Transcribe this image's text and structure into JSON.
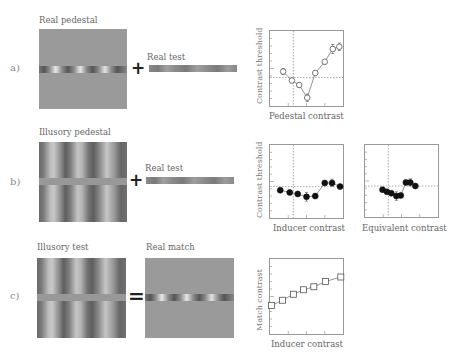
{
  "rows": [
    {
      "row_label": "a)",
      "stimulus_label": "Real pedestal",
      "stimulus_type": "real-grating-strip-on-uniform-gray",
      "operator": "+",
      "test_label": "Real test"
    },
    {
      "row_label": "b)",
      "stimulus_label": "Illusory pedestal",
      "stimulus_type": "inducing-grating-with-gray-strip",
      "operator": "+",
      "test_label": "Real test"
    },
    {
      "row_label": "c)",
      "stimulus_label": "Illusory test",
      "stimulus_type": "inducing-grating-with-gray-strip",
      "operator": "=",
      "test_label": "Real match"
    }
  ],
  "chart_data": [
    {
      "id": "a",
      "type": "line",
      "title": "",
      "xlabel": "Pedestal contrast",
      "ylabel": "Contrast threshold",
      "marker": "open-circle",
      "grid": false,
      "reference_lines": {
        "vertical_x": 0.32,
        "horizontal_y": 0.62
      },
      "points": [
        {
          "x": 0.18,
          "y": 0.54,
          "err": 0.04
        },
        {
          "x": 0.3,
          "y": 0.66,
          "err": 0.03
        },
        {
          "x": 0.4,
          "y": 0.72,
          "err": 0.03
        },
        {
          "x": 0.51,
          "y": 0.89,
          "err": 0.05
        },
        {
          "x": 0.62,
          "y": 0.56,
          "err": 0.03
        },
        {
          "x": 0.75,
          "y": 0.41,
          "err": 0.03
        },
        {
          "x": 0.86,
          "y": 0.24,
          "err": 0.06
        },
        {
          "x": 0.95,
          "y": 0.21,
          "err": 0.05
        }
      ],
      "note": "Normalized frame coordinates (x: 0=left,1=right; y: 0=top,1=bottom). Dipper function."
    },
    {
      "id": "b-inducer",
      "type": "line",
      "title": "",
      "xlabel": "Inducer contrast",
      "ylabel": "Contrast threshold",
      "marker": "filled-circle",
      "grid": false,
      "reference_lines": {
        "vertical_x": 0.32,
        "horizontal_y": 0.57
      },
      "points": [
        {
          "x": 0.14,
          "y": 0.62,
          "err": 0.03
        },
        {
          "x": 0.27,
          "y": 0.65,
          "err": 0.03
        },
        {
          "x": 0.38,
          "y": 0.67,
          "err": 0.03
        },
        {
          "x": 0.5,
          "y": 0.71,
          "err": 0.06
        },
        {
          "x": 0.62,
          "y": 0.7,
          "err": 0.03
        },
        {
          "x": 0.75,
          "y": 0.52,
          "err": 0.03
        },
        {
          "x": 0.85,
          "y": 0.52,
          "err": 0.05
        },
        {
          "x": 0.96,
          "y": 0.57,
          "err": 0.03
        }
      ]
    },
    {
      "id": "b-equivalent",
      "type": "line",
      "title": "",
      "xlabel": "Equivalent contrast",
      "ylabel": "",
      "marker": "filled-circle",
      "grid": false,
      "reference_lines": {
        "vertical_x": 0.32,
        "horizontal_y": 0.57
      },
      "points": [
        {
          "x": 0.24,
          "y": 0.62,
          "err": 0.03
        },
        {
          "x": 0.3,
          "y": 0.65,
          "err": 0.03
        },
        {
          "x": 0.36,
          "y": 0.67,
          "err": 0.03
        },
        {
          "x": 0.43,
          "y": 0.71,
          "err": 0.06
        },
        {
          "x": 0.49,
          "y": 0.7,
          "err": 0.03
        },
        {
          "x": 0.56,
          "y": 0.52,
          "err": 0.03
        },
        {
          "x": 0.62,
          "y": 0.52,
          "err": 0.05
        },
        {
          "x": 0.69,
          "y": 0.57,
          "err": 0.03
        }
      ]
    },
    {
      "id": "c",
      "type": "line",
      "title": "",
      "xlabel": "Inducer contrast",
      "ylabel": "Match contrast",
      "marker": "open-square",
      "grid": false,
      "points": [
        {
          "x": 0.02,
          "y": 0.62
        },
        {
          "x": 0.17,
          "y": 0.55
        },
        {
          "x": 0.32,
          "y": 0.47
        },
        {
          "x": 0.46,
          "y": 0.41
        },
        {
          "x": 0.6,
          "y": 0.37
        },
        {
          "x": 0.76,
          "y": 0.3
        },
        {
          "x": 0.97,
          "y": 0.24
        }
      ],
      "note": "Roughly linear increase of match contrast with inducer contrast."
    }
  ]
}
